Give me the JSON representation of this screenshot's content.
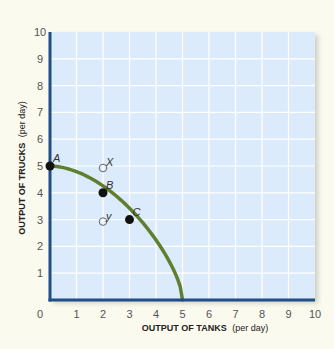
{
  "chart_data": {
    "type": "line",
    "title": "",
    "xlabel": "OUTPUT OF TANKS",
    "xlabel_unit": "(per day)",
    "ylabel": "OUTPUT OF TRUCKS",
    "ylabel_unit": "(per day)",
    "xlim": [
      0,
      10
    ],
    "ylim": [
      0,
      10
    ],
    "x_ticks": [
      0,
      1,
      2,
      3,
      4,
      5,
      6,
      7,
      8,
      9,
      10
    ],
    "y_ticks": [
      1,
      2,
      3,
      4,
      5,
      6,
      7,
      8,
      9,
      10
    ],
    "grid": true,
    "series": [
      {
        "name": "Production possibilities curve",
        "color": "#5f7f2f",
        "x": [
          0,
          1,
          2,
          3,
          4,
          5
        ],
        "y": [
          5,
          4.7,
          4,
          3,
          1.7,
          0
        ]
      }
    ],
    "points": [
      {
        "label": "A",
        "x": 0,
        "y": 5,
        "filled": true
      },
      {
        "label": "B",
        "x": 2,
        "y": 4,
        "filled": true
      },
      {
        "label": "C",
        "x": 3,
        "y": 3,
        "filled": true
      },
      {
        "label": "X",
        "x": 2,
        "y": 5,
        "filled": false
      },
      {
        "label": "Y",
        "x": 2,
        "y": 3,
        "filled": false
      }
    ],
    "colors": {
      "background": "#fbfaee",
      "plot_area": "#dcebfb",
      "grid": "#ffffff",
      "axis": "#1f4f86",
      "curve": "#5f7f2f"
    }
  }
}
